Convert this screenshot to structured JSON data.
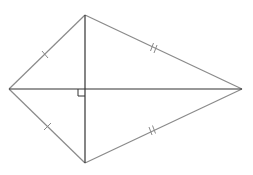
{
  "diagram": {
    "type": "kite",
    "vertices": {
      "left": [
        9,
        89
      ],
      "top": [
        85,
        15
      ],
      "right": [
        242,
        89
      ],
      "bottom": [
        85,
        163
      ]
    },
    "diagonal_intersection": [
      85,
      89
    ],
    "edges": [
      {
        "name": "left-top",
        "from": "left",
        "to": "top",
        "ticks": 1
      },
      {
        "name": "top-right",
        "from": "top",
        "to": "right",
        "ticks": 2
      },
      {
        "name": "right-bottom",
        "from": "right",
        "to": "bottom",
        "ticks": 2
      },
      {
        "name": "bottom-left",
        "from": "bottom",
        "to": "left",
        "ticks": 1
      }
    ],
    "right_angle_marker": {
      "at": [
        85,
        89
      ],
      "size": 7,
      "quadrant": "lower-left"
    },
    "colors": {
      "edge": "#8a8a8a",
      "diagonal": "#333333",
      "background": "#ffffff"
    }
  }
}
